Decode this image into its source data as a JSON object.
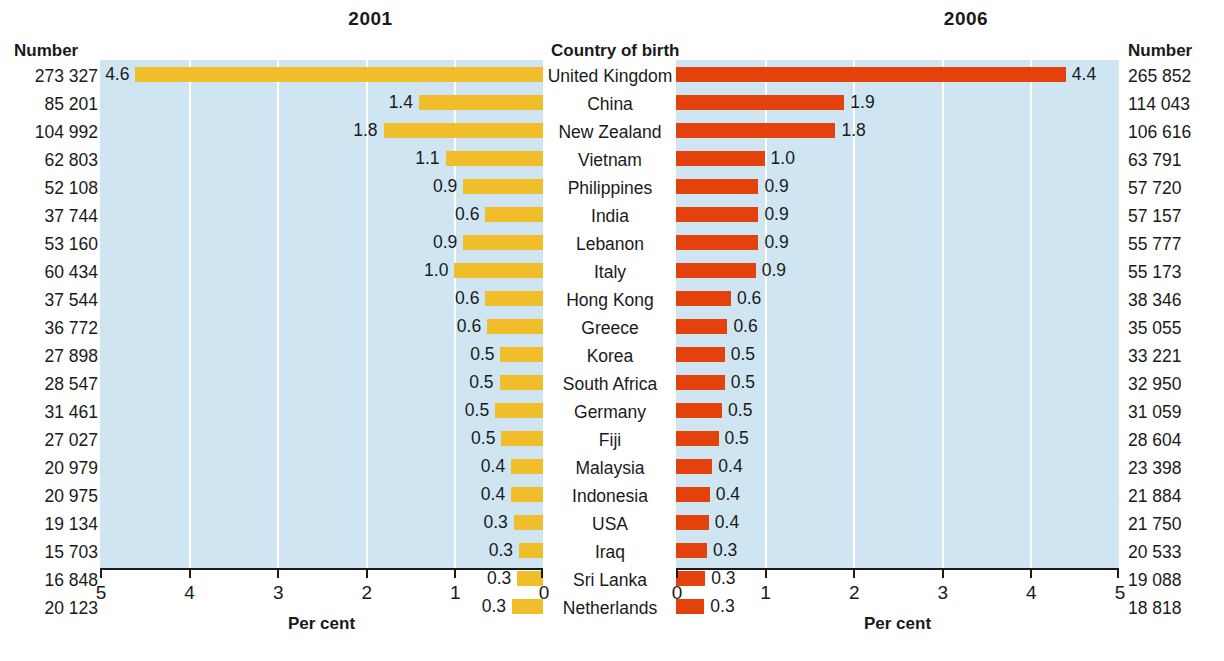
{
  "headers": {
    "number_left": "Number",
    "country": "Country of birth",
    "number_right": "Number"
  },
  "titles": {
    "left": "2001",
    "right": "2006"
  },
  "axis": {
    "title": "Per cent",
    "left_ticks": [
      "5",
      "4",
      "3",
      "2",
      "1",
      "0"
    ],
    "right_ticks": [
      "0",
      "1",
      "2",
      "3",
      "4",
      "5"
    ],
    "left_range": [
      5,
      0
    ],
    "right_range": [
      0,
      5
    ]
  },
  "colors": {
    "bar_2001": "#efbe2a",
    "bar_2006": "#e3420c",
    "plot_background": "#cfe6f2",
    "gridline": "#ffffff",
    "text": "#1a1a1a"
  },
  "chart_data": {
    "type": "bar",
    "xlabel": "Per cent",
    "ylabel": "Country of birth",
    "orientation": "horizontal",
    "layout": "back-to-back / diverging pyramid",
    "grid": true,
    "legend": "none",
    "categories": [
      "United Kingdom",
      "China",
      "New Zealand",
      "Vietnam",
      "Philippines",
      "India",
      "Lebanon",
      "Italy",
      "Hong Kong",
      "Greece",
      "Korea",
      "South Africa",
      "Germany",
      "Fiji",
      "Malaysia",
      "Indonesia",
      "USA",
      "Iraq",
      "Sri Lanka",
      "Netherlands"
    ],
    "series": [
      {
        "name": "2001",
        "side": "left",
        "color": "#efbe2a",
        "xlim": [
          5,
          0
        ],
        "percent_values": [
          4.6,
          1.4,
          1.8,
          1.1,
          0.9,
          0.6,
          0.9,
          1.0,
          0.6,
          0.6,
          0.5,
          0.5,
          0.5,
          0.5,
          0.4,
          0.4,
          0.3,
          0.3,
          0.3,
          0.3
        ],
        "percent_labels": [
          "4.6",
          "1.4",
          "1.8",
          "1.1",
          "0.9",
          "0.6",
          "0.9",
          "1.0",
          "0.6",
          "0.6",
          "0.5",
          "0.5",
          "0.5",
          "0.5",
          "0.4",
          "0.4",
          "0.3",
          "0.3",
          "0.3",
          "0.3"
        ],
        "number_labels": [
          "273 327",
          "85 201",
          "104 992",
          "62 803",
          "52 108",
          "37 744",
          "53 160",
          "60 434",
          "37 544",
          "36 772",
          "27 898",
          "28 547",
          "31 461",
          "27 027",
          "20 979",
          "20 975",
          "19 134",
          "15 703",
          "16 848",
          "20 123"
        ],
        "numbers": [
          273327,
          85201,
          104992,
          62803,
          52108,
          37744,
          53160,
          60434,
          37544,
          36772,
          27898,
          28547,
          31461,
          27027,
          20979,
          20975,
          19134,
          15703,
          16848,
          20123
        ],
        "bar_lengths_percent": [
          4.6,
          1.4,
          1.8,
          1.1,
          0.9,
          0.65,
          0.9,
          1.0,
          0.65,
          0.63,
          0.48,
          0.49,
          0.54,
          0.47,
          0.36,
          0.36,
          0.33,
          0.27,
          0.29,
          0.35
        ]
      },
      {
        "name": "2006",
        "side": "right",
        "color": "#e3420c",
        "xlim": [
          0,
          5
        ],
        "percent_values": [
          4.4,
          1.9,
          1.8,
          1.0,
          0.9,
          0.9,
          0.9,
          0.9,
          0.6,
          0.6,
          0.5,
          0.5,
          0.5,
          0.5,
          0.4,
          0.4,
          0.4,
          0.3,
          0.3,
          0.3
        ],
        "percent_labels": [
          "4.4",
          "1.9",
          "1.8",
          "1.0",
          "0.9",
          "0.9",
          "0.9",
          "0.9",
          "0.6",
          "0.6",
          "0.5",
          "0.5",
          "0.5",
          "0.5",
          "0.4",
          "0.4",
          "0.4",
          "0.3",
          "0.3",
          "0.3"
        ],
        "number_labels": [
          "265 852",
          "114 043",
          "106 616",
          "63 791",
          "57 720",
          "57 157",
          "55 777",
          "55 173",
          "38 346",
          "35 055",
          "33 221",
          "32 950",
          "31 059",
          "28 604",
          "23 398",
          "21 884",
          "21 750",
          "20 533",
          "19 088",
          "18 818"
        ],
        "numbers": [
          265852,
          114043,
          106616,
          63791,
          57720,
          57157,
          55777,
          55173,
          38346,
          35055,
          33221,
          32950,
          31059,
          28604,
          23398,
          21884,
          21750,
          20533,
          19088,
          18818
        ],
        "bar_lengths_percent": [
          4.4,
          1.9,
          1.8,
          1.0,
          0.93,
          0.93,
          0.93,
          0.9,
          0.62,
          0.58,
          0.55,
          0.55,
          0.52,
          0.48,
          0.41,
          0.38,
          0.37,
          0.35,
          0.33,
          0.32
        ]
      }
    ]
  }
}
